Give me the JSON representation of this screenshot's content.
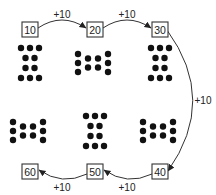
{
  "diagram": {
    "type": "counting-by-tens",
    "boxes": [
      {
        "id": "b10",
        "value": "10",
        "x": 22,
        "y": 22
      },
      {
        "id": "b20",
        "value": "20",
        "x": 87,
        "y": 22
      },
      {
        "id": "b30",
        "value": "30",
        "x": 152,
        "y": 22
      },
      {
        "id": "b40",
        "value": "40",
        "x": 152,
        "y": 164
      },
      {
        "id": "b50",
        "value": "50",
        "x": 87,
        "y": 164
      },
      {
        "id": "b60",
        "value": "60",
        "x": 22,
        "y": 164
      }
    ],
    "step_labels": [
      {
        "text": "+10",
        "x": 62,
        "y": 14
      },
      {
        "text": "+10",
        "x": 127,
        "y": 14
      },
      {
        "text": "+10",
        "x": 203,
        "y": 100
      },
      {
        "text": "+10",
        "x": 127,
        "y": 187
      },
      {
        "text": "+10",
        "x": 62,
        "y": 187
      }
    ],
    "dot_groups": [
      {
        "name": "group-1",
        "orientation": "vertical",
        "cx": 30,
        "cy": 63,
        "count": 10
      },
      {
        "name": "group-2",
        "orientation": "horizontal",
        "cx": 93,
        "cy": 63,
        "count": 10
      },
      {
        "name": "group-3",
        "orientation": "vertical",
        "cx": 160,
        "cy": 63,
        "count": 10
      },
      {
        "name": "group-4",
        "orientation": "horizontal",
        "cx": 28,
        "cy": 131,
        "count": 10
      },
      {
        "name": "group-5",
        "orientation": "vertical",
        "cx": 95,
        "cy": 131,
        "count": 10
      },
      {
        "name": "group-6",
        "orientation": "horizontal",
        "cx": 158,
        "cy": 131,
        "count": 10
      }
    ],
    "colors": {
      "stroke": "#333333",
      "dot": "#111111",
      "background": "#ffffff"
    }
  }
}
